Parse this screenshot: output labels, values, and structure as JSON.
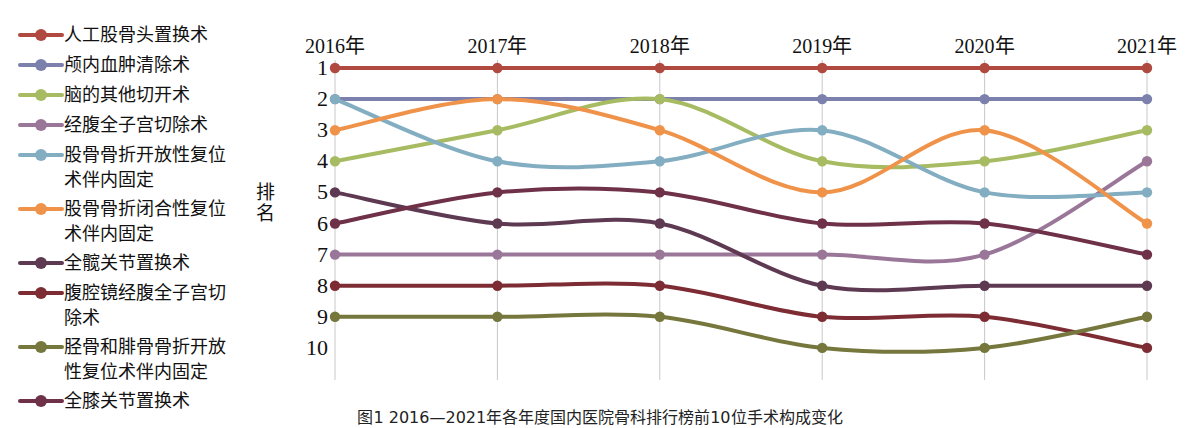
{
  "axis": {
    "y_label": "排名",
    "y_ticks": [
      "1",
      "2",
      "3",
      "4",
      "5",
      "6",
      "7",
      "8",
      "9",
      "10"
    ],
    "x_ticks": [
      "2016年",
      "2017年",
      "2018年",
      "2019年",
      "2020年",
      "2021年"
    ]
  },
  "caption": {
    "text": "图1  2016—2021年各年度国内医院骨科排行榜前10位手术构成变化"
  },
  "legend": {
    "items": [
      {
        "label": "人工股骨头置换术",
        "color": "#b0493f"
      },
      {
        "label": "颅内血肿清除术",
        "color": "#7b80ad"
      },
      {
        "label": "脑的其他切开术",
        "color": "#a7bb62"
      },
      {
        "label": "经腹全子宫切除术",
        "color": "#9a7699"
      },
      {
        "label": "股骨骨折开放性复位\n术伴内固定",
        "color": "#83aec2"
      },
      {
        "label": "股骨骨折闭合性复位\n术伴内固定",
        "color": "#f0934a"
      },
      {
        "label": "全髋关节置换术",
        "color": "#5d3a52"
      },
      {
        "label": "腹腔镜经腹全子宫切\n除术",
        "color": "#7d2c34"
      },
      {
        "label": "胫骨和腓骨骨折开放\n性复位术伴内固定",
        "color": "#75773c"
      },
      {
        "label": "全膝关节置换术",
        "color": "#6e3148"
      }
    ]
  },
  "chart_data": {
    "type": "line",
    "title": "",
    "xlabel": "",
    "ylabel": "排名",
    "categories": [
      "2016年",
      "2017年",
      "2018年",
      "2019年",
      "2020年",
      "2021年"
    ],
    "ylim": [
      1,
      10
    ],
    "y_inverted": true,
    "grid": "vertical",
    "legend_position": "left",
    "series": [
      {
        "name": "人工股骨头置换术",
        "color": "#b0493f",
        "values": [
          1,
          1,
          1,
          1,
          1,
          1
        ]
      },
      {
        "name": "颅内血肿清除术",
        "color": "#7b80ad",
        "values": [
          2,
          2,
          2,
          2,
          2,
          2
        ]
      },
      {
        "name": "脑的其他切开术",
        "color": "#a7bb62",
        "values": [
          4,
          3,
          2,
          4,
          4,
          3
        ]
      },
      {
        "name": "经腹全子宫切除术",
        "color": "#9a7699",
        "values": [
          7,
          7,
          7,
          7,
          7,
          4
        ]
      },
      {
        "name": "股骨骨折开放性复位术伴内固定",
        "color": "#83aec2",
        "values": [
          2,
          4,
          4,
          3,
          5,
          5
        ]
      },
      {
        "name": "股骨骨折闭合性复位术伴内固定",
        "color": "#f0934a",
        "values": [
          3,
          2,
          3,
          5,
          3,
          6
        ]
      },
      {
        "name": "全髋关节置换术",
        "color": "#5d3a52",
        "values": [
          5,
          6,
          6,
          8,
          8,
          8
        ]
      },
      {
        "name": "腹腔镜经腹全子宫切除术",
        "color": "#7d2c34",
        "values": [
          8,
          8,
          8,
          9,
          9,
          10
        ]
      },
      {
        "name": "胫骨和腓骨骨折开放性复位术伴内固定",
        "color": "#75773c",
        "values": [
          9,
          9,
          9,
          10,
          10,
          9
        ]
      },
      {
        "name": "全膝关节置换术",
        "color": "#6e3148",
        "values": [
          6,
          5,
          5,
          6,
          6,
          7
        ]
      }
    ]
  },
  "geometry": {
    "x0": 335,
    "dx": 162.4,
    "y0": 68,
    "dy": 31.1
  }
}
